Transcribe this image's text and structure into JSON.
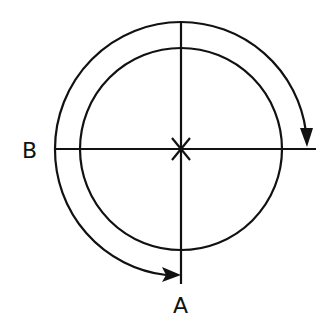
{
  "diagram": {
    "labels": {
      "a": "A",
      "b": "B",
      "center_mark": "X"
    },
    "colors": {
      "stroke": "#111111",
      "background": "#ffffff"
    },
    "elements": [
      {
        "type": "circle",
        "name": "inner-circle"
      },
      {
        "type": "arc-arrow",
        "name": "outer-arc-clockwise",
        "from": "B",
        "to": "right-horizontal"
      },
      {
        "type": "arc-arrow",
        "name": "lower-left-arc",
        "from": "B",
        "to": "A"
      },
      {
        "type": "line",
        "name": "horizontal-axis"
      },
      {
        "type": "line",
        "name": "vertical-axis"
      }
    ]
  }
}
